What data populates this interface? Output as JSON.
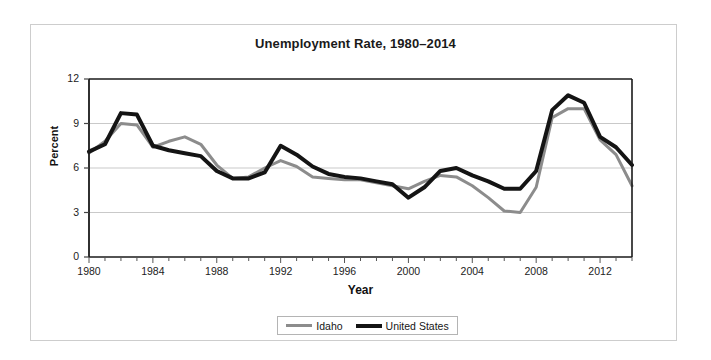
{
  "chart_data": {
    "type": "line",
    "title": "Unemployment Rate, 1980–2014",
    "xlabel": "Year",
    "ylabel": "Percent",
    "xlim": [
      1980,
      2014
    ],
    "ylim": [
      0,
      12
    ],
    "yticks": [
      0,
      3,
      6,
      9,
      12
    ],
    "ytick_labels": [
      "0",
      "3",
      "6",
      "9",
      "12"
    ],
    "xticks": [
      1980,
      1984,
      1988,
      1992,
      1996,
      2000,
      2004,
      2008,
      2012
    ],
    "xtick_labels": [
      "1980",
      "1984",
      "1988",
      "1992",
      "1996",
      "2000",
      "2004",
      "2008",
      "2012"
    ],
    "minor_xtick_interval": 1,
    "grid": "horizontal",
    "legend_position": "bottom-center",
    "x": [
      1980,
      1981,
      1982,
      1983,
      1984,
      1985,
      1986,
      1987,
      1988,
      1989,
      1990,
      1991,
      1992,
      1993,
      1994,
      1995,
      1996,
      1997,
      1998,
      1999,
      2000,
      2001,
      2002,
      2003,
      2004,
      2005,
      2006,
      2007,
      2008,
      2009,
      2010,
      2011,
      2012,
      2013,
      2014
    ],
    "series": [
      {
        "name": "Idaho",
        "color": "#8c8c8c",
        "line_width": 3,
        "values": [
          7.0,
          7.8,
          9.0,
          8.9,
          7.4,
          7.8,
          8.1,
          7.6,
          6.2,
          5.3,
          5.4,
          6.0,
          6.5,
          6.1,
          5.4,
          5.3,
          5.2,
          5.2,
          5.0,
          4.8,
          4.6,
          5.1,
          5.5,
          5.4,
          4.8,
          4.0,
          3.1,
          3.0,
          4.7,
          9.4,
          10.0,
          10.0,
          7.9,
          6.9,
          4.8
        ]
      },
      {
        "name": "United States",
        "color": "#141414",
        "line_width": 4,
        "values": [
          7.1,
          7.6,
          9.7,
          9.6,
          7.5,
          7.2,
          7.0,
          6.8,
          5.8,
          5.3,
          5.3,
          5.7,
          7.5,
          6.9,
          6.1,
          5.6,
          5.4,
          5.3,
          5.1,
          4.9,
          4.0,
          4.7,
          5.8,
          6.0,
          5.5,
          5.1,
          4.6,
          4.6,
          5.8,
          9.9,
          10.9,
          10.4,
          8.1,
          7.4,
          6.2
        ]
      }
    ]
  }
}
